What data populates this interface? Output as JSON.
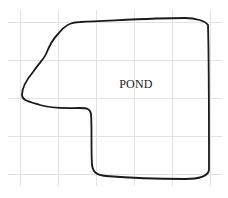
{
  "diagram": {
    "type": "grid-map",
    "region_label": "POND",
    "colors": {
      "background": "#ffffff",
      "grid": "#e2e2e2",
      "outline": "#1a1a1a",
      "text": "#1a1a1a"
    },
    "grid": {
      "vertical_lines_x": [
        20,
        58,
        96,
        134,
        172,
        210
      ],
      "horizontal_lines_y": [
        22,
        60,
        98,
        136,
        174
      ],
      "extent": {
        "x1": 20,
        "y1": 10,
        "x2": 210,
        "y2": 186
      }
    }
  }
}
